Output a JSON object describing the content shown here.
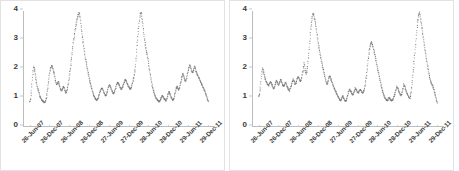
{
  "figure": {
    "title": "",
    "panel_count": 2
  },
  "chart_data": [
    {
      "type": "scatter",
      "title": "",
      "xlabel": "",
      "ylabel": "",
      "ylim": [
        0,
        4
      ],
      "yticks": [
        0,
        1,
        2,
        3,
        4
      ],
      "ytick_labels": [
        "0",
        "1",
        "2",
        "3",
        "4"
      ],
      "grid": false,
      "legend": "none",
      "marker_color": "#6e6e6e",
      "xtick_labels": [
        "26-Jun-07",
        "26-Dec-07",
        "26-Jun-08",
        "26-Dec-08",
        "27-Jun-09",
        "27-Dec-09",
        "28-Jun-10",
        "28-Dec-10",
        "29-Jun-11",
        "29-Dec-11"
      ],
      "xtick_positions": [
        0.035,
        0.138,
        0.241,
        0.344,
        0.447,
        0.55,
        0.653,
        0.756,
        0.859,
        0.962
      ],
      "x": [
        0.03,
        0.035,
        0.04,
        0.046,
        0.051,
        0.056,
        0.061,
        0.066,
        0.071,
        0.077,
        0.082,
        0.087,
        0.092,
        0.097,
        0.102,
        0.108,
        0.113,
        0.118,
        0.123,
        0.128,
        0.133,
        0.139,
        0.144,
        0.149,
        0.154,
        0.159,
        0.164,
        0.17,
        0.175,
        0.18,
        0.185,
        0.19,
        0.195,
        0.201,
        0.206,
        0.211,
        0.216,
        0.221,
        0.226,
        0.232,
        0.237,
        0.242,
        0.247,
        0.252,
        0.257,
        0.263,
        0.268,
        0.273,
        0.278,
        0.283,
        0.288,
        0.294,
        0.299,
        0.304,
        0.309,
        0.314,
        0.319,
        0.325,
        0.33,
        0.335,
        0.34,
        0.345,
        0.35,
        0.356,
        0.361,
        0.366,
        0.371,
        0.376,
        0.381,
        0.387,
        0.392,
        0.397,
        0.402,
        0.407,
        0.412,
        0.418,
        0.423,
        0.428,
        0.433,
        0.438,
        0.443,
        0.449,
        0.454,
        0.459,
        0.464,
        0.469,
        0.474,
        0.48,
        0.485,
        0.49,
        0.495,
        0.5,
        0.505,
        0.511,
        0.516,
        0.521,
        0.526,
        0.531,
        0.536,
        0.542,
        0.547,
        0.552,
        0.557,
        0.562,
        0.567,
        0.573,
        0.578,
        0.583,
        0.588,
        0.593,
        0.598,
        0.604,
        0.609,
        0.614,
        0.619,
        0.624,
        0.629,
        0.635,
        0.64,
        0.645,
        0.65,
        0.655,
        0.66,
        0.666,
        0.671,
        0.676,
        0.681,
        0.686,
        0.691,
        0.697,
        0.702,
        0.707,
        0.712,
        0.717,
        0.722,
        0.728,
        0.733,
        0.738,
        0.743,
        0.748,
        0.753,
        0.759,
        0.764,
        0.769,
        0.774,
        0.779,
        0.784,
        0.79,
        0.795,
        0.8,
        0.805,
        0.81,
        0.815,
        0.821,
        0.826,
        0.831,
        0.836,
        0.841,
        0.846,
        0.852,
        0.857,
        0.862,
        0.867,
        0.872,
        0.877,
        0.883,
        0.888,
        0.893,
        0.898,
        0.903,
        0.908,
        0.914,
        0.919,
        0.924,
        0.929,
        0.934,
        0.939,
        0.945,
        0.95,
        0.955,
        0.96,
        0.965
      ],
      "y": [
        0.82,
        0.95,
        1.35,
        1.8,
        2.08,
        1.95,
        1.7,
        1.48,
        1.32,
        1.22,
        1.05,
        0.98,
        0.92,
        0.88,
        0.84,
        0.82,
        0.86,
        1.0,
        1.25,
        1.55,
        1.82,
        2.0,
        2.1,
        2.05,
        1.92,
        1.8,
        1.6,
        1.45,
        1.48,
        1.55,
        1.42,
        1.3,
        1.22,
        1.28,
        1.38,
        1.32,
        1.2,
        1.15,
        1.28,
        1.45,
        1.7,
        1.95,
        2.25,
        2.55,
        2.85,
        3.1,
        3.35,
        3.55,
        3.72,
        3.85,
        3.95,
        3.78,
        3.5,
        3.2,
        2.95,
        2.7,
        2.45,
        2.25,
        2.05,
        1.88,
        1.72,
        1.55,
        1.42,
        1.28,
        1.15,
        1.05,
        0.98,
        0.92,
        0.9,
        0.95,
        1.05,
        1.18,
        1.25,
        1.32,
        1.28,
        1.18,
        1.1,
        1.05,
        1.12,
        1.25,
        1.38,
        1.42,
        1.35,
        1.25,
        1.18,
        1.12,
        1.2,
        1.32,
        1.45,
        1.52,
        1.48,
        1.4,
        1.32,
        1.28,
        1.35,
        1.45,
        1.55,
        1.62,
        1.55,
        1.45,
        1.38,
        1.32,
        1.28,
        1.35,
        1.48,
        1.62,
        1.8,
        2.05,
        2.45,
        2.9,
        3.3,
        3.65,
        3.9,
        3.95,
        3.7,
        3.4,
        3.1,
        2.85,
        2.62,
        2.48,
        2.3,
        2.05,
        1.82,
        1.6,
        1.42,
        1.28,
        1.15,
        1.05,
        0.98,
        0.92,
        0.88,
        0.85,
        0.88,
        0.95,
        1.05,
        1.02,
        0.95,
        0.92,
        0.88,
        0.95,
        1.08,
        1.2,
        1.12,
        1.02,
        0.95,
        0.9,
        0.95,
        1.1,
        1.25,
        1.38,
        1.32,
        1.25,
        1.35,
        1.52,
        1.68,
        1.82,
        1.75,
        1.62,
        1.55,
        1.68,
        1.85,
        2.0,
        2.12,
        2.05,
        1.92,
        1.85,
        1.95,
        2.08,
        1.98,
        1.85,
        1.78,
        1.7,
        1.62,
        1.55,
        1.48,
        1.4,
        1.32,
        1.25,
        1.15,
        1.05,
        0.95,
        0.85,
        0.78,
        0.7,
        0.65,
        0.72,
        0.85,
        0.92
      ]
    },
    {
      "type": "scatter",
      "title": "",
      "xlabel": "",
      "ylabel": "",
      "ylim": [
        0,
        4
      ],
      "yticks": [
        0,
        1,
        2,
        3,
        4
      ],
      "ytick_labels": [
        "0",
        "1",
        "2",
        "3",
        "4"
      ],
      "grid": false,
      "legend": "none",
      "marker_color": "#6e6e6e",
      "xtick_labels": [
        "26-Jun-07",
        "26-Dec-07",
        "26-Jun-08",
        "26-Dec-08",
        "27-Jun-09",
        "27-Dec-09",
        "28-Jun-10",
        "28-Dec-10",
        "29-Jun-11",
        "29-Dec-11"
      ],
      "xtick_positions": [
        0.035,
        0.138,
        0.241,
        0.344,
        0.447,
        0.55,
        0.653,
        0.756,
        0.859,
        0.962
      ],
      "x": [
        0.03,
        0.035,
        0.04,
        0.046,
        0.051,
        0.056,
        0.061,
        0.066,
        0.071,
        0.077,
        0.082,
        0.087,
        0.092,
        0.097,
        0.102,
        0.108,
        0.113,
        0.118,
        0.123,
        0.128,
        0.133,
        0.139,
        0.144,
        0.149,
        0.154,
        0.159,
        0.164,
        0.17,
        0.175,
        0.18,
        0.185,
        0.19,
        0.195,
        0.201,
        0.206,
        0.211,
        0.216,
        0.221,
        0.226,
        0.232,
        0.237,
        0.242,
        0.247,
        0.252,
        0.257,
        0.263,
        0.268,
        0.273,
        0.278,
        0.283,
        0.288,
        0.294,
        0.299,
        0.304,
        0.309,
        0.314,
        0.319,
        0.325,
        0.33,
        0.335,
        0.34,
        0.345,
        0.35,
        0.356,
        0.361,
        0.366,
        0.371,
        0.376,
        0.381,
        0.387,
        0.392,
        0.397,
        0.402,
        0.407,
        0.412,
        0.418,
        0.423,
        0.428,
        0.433,
        0.438,
        0.443,
        0.449,
        0.454,
        0.459,
        0.464,
        0.469,
        0.474,
        0.48,
        0.485,
        0.49,
        0.495,
        0.5,
        0.505,
        0.511,
        0.516,
        0.521,
        0.526,
        0.531,
        0.536,
        0.542,
        0.547,
        0.552,
        0.557,
        0.562,
        0.567,
        0.573,
        0.578,
        0.583,
        0.588,
        0.593,
        0.598,
        0.604,
        0.609,
        0.614,
        0.619,
        0.624,
        0.629,
        0.635,
        0.64,
        0.645,
        0.65,
        0.655,
        0.66,
        0.666,
        0.671,
        0.676,
        0.681,
        0.686,
        0.691,
        0.697,
        0.702,
        0.707,
        0.712,
        0.717,
        0.722,
        0.728,
        0.733,
        0.738,
        0.743,
        0.748,
        0.753,
        0.759,
        0.764,
        0.769,
        0.774,
        0.779,
        0.784,
        0.79,
        0.795,
        0.8,
        0.805,
        0.81,
        0.815,
        0.821,
        0.826,
        0.831,
        0.836,
        0.841,
        0.846,
        0.852,
        0.857,
        0.862,
        0.867,
        0.872,
        0.877,
        0.883,
        0.888,
        0.893,
        0.898,
        0.903,
        0.908,
        0.914,
        0.919,
        0.924,
        0.929,
        0.934,
        0.939,
        0.945,
        0.95,
        0.955,
        0.96,
        0.965
      ],
      "y": [
        1.02,
        1.12,
        1.45,
        1.82,
        2.02,
        1.88,
        1.72,
        1.6,
        1.52,
        1.45,
        1.4,
        1.48,
        1.55,
        1.48,
        1.38,
        1.3,
        1.35,
        1.48,
        1.58,
        1.52,
        1.42,
        1.5,
        1.62,
        1.55,
        1.45,
        1.38,
        1.42,
        1.52,
        1.45,
        1.35,
        1.28,
        1.22,
        1.3,
        1.42,
        1.55,
        1.62,
        1.55,
        1.45,
        1.5,
        1.65,
        1.72,
        1.65,
        1.55,
        1.6,
        1.75,
        1.95,
        2.2,
        1.95,
        1.8,
        1.92,
        2.25,
        2.65,
        3.05,
        3.45,
        3.75,
        3.92,
        3.85,
        3.65,
        3.45,
        3.2,
        2.95,
        2.75,
        2.55,
        2.35,
        2.18,
        2.02,
        1.88,
        1.72,
        1.58,
        1.45,
        1.52,
        1.68,
        1.75,
        1.65,
        1.55,
        1.45,
        1.35,
        1.28,
        1.2,
        1.12,
        1.05,
        0.98,
        0.92,
        0.88,
        0.95,
        1.05,
        0.98,
        0.9,
        0.85,
        0.92,
        1.05,
        1.18,
        1.28,
        1.22,
        1.15,
        1.08,
        1.12,
        1.22,
        1.32,
        1.25,
        1.18,
        1.15,
        1.22,
        1.28,
        1.22,
        1.15,
        1.18,
        1.28,
        1.45,
        1.7,
        2.0,
        2.35,
        2.62,
        2.8,
        2.92,
        2.85,
        2.72,
        2.58,
        2.42,
        2.25,
        2.08,
        1.92,
        1.75,
        1.58,
        1.42,
        1.28,
        1.15,
        1.05,
        0.98,
        0.92,
        0.88,
        0.92,
        1.0,
        0.95,
        0.9,
        0.88,
        0.92,
        1.02,
        1.12,
        1.25,
        1.38,
        1.3,
        1.2,
        1.12,
        1.05,
        1.12,
        1.28,
        1.45,
        1.38,
        1.25,
        1.15,
        1.08,
        1.02,
        0.95,
        1.1,
        1.35,
        1.68,
        2.05,
        2.45,
        2.85,
        3.25,
        3.6,
        3.85,
        3.95,
        3.75,
        3.5,
        3.25,
        3.0,
        2.78,
        2.55,
        2.32,
        2.1,
        1.9,
        1.72,
        1.58,
        1.48,
        1.42,
        1.32,
        1.18,
        1.05,
        0.92,
        0.8,
        0.7,
        0.62,
        0.58,
        0.62,
        0.68
      ]
    }
  ]
}
